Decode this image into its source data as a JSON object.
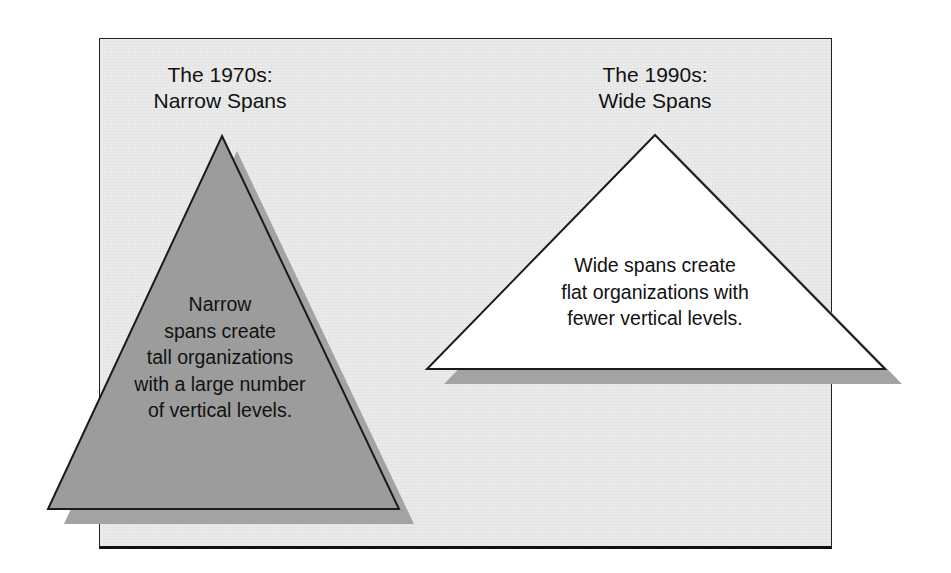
{
  "colors": {
    "frame_background": "#ebebeb",
    "frame_border": "#222222",
    "narrow_triangle_fill": "#9c9c9c",
    "wide_triangle_fill": "#ffffff",
    "shadow_fill": "#a3a3a3",
    "outline": "#1a1a1a",
    "text": "#111111"
  },
  "left_panel": {
    "heading_line1": "The 1970s:",
    "heading_line2": "Narrow Spans",
    "triangle_label": "narrow spans triangle",
    "text_lines": [
      "Narrow",
      "spans create",
      "tall organizations",
      "with a large number",
      "of vertical levels."
    ]
  },
  "right_panel": {
    "heading_line1": "The 1990s:",
    "heading_line2": "Wide Spans",
    "triangle_label": "wide spans triangle",
    "text_lines": [
      "Wide spans create",
      "flat organizations with",
      "fewer vertical levels."
    ]
  }
}
